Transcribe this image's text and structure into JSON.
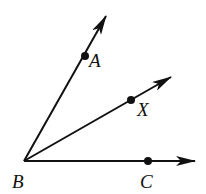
{
  "diagram": {
    "stroke_color": "#111111",
    "background": "#ffffff",
    "vertex": {
      "label": "B",
      "x": 24,
      "y": 161,
      "label_x": 12,
      "label_y": 188
    },
    "rays": [
      {
        "name": "ray-BA",
        "x2": 106,
        "y2": 16,
        "point": {
          "label": "A",
          "x": 85,
          "y": 56,
          "label_x": 89,
          "label_y": 67
        }
      },
      {
        "name": "ray-BX",
        "x2": 171,
        "y2": 77,
        "point": {
          "label": "X",
          "x": 131,
          "y": 100,
          "label_x": 137,
          "label_y": 116
        }
      },
      {
        "name": "ray-BC",
        "x2": 195,
        "y2": 161,
        "point": {
          "label": "C",
          "x": 148,
          "y": 161,
          "label_x": 140,
          "label_y": 188
        }
      }
    ]
  }
}
